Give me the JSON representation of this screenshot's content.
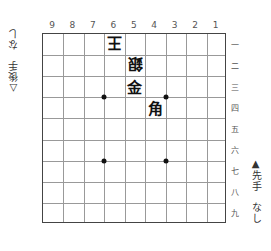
{
  "board": {
    "files": [
      "9",
      "8",
      "7",
      "6",
      "5",
      "4",
      "3",
      "2",
      "1"
    ],
    "ranks": [
      "一",
      "二",
      "三",
      "四",
      "五",
      "六",
      "七",
      "八",
      "九"
    ],
    "star_points": [
      {
        "file_index": 3,
        "rank_index": 3
      },
      {
        "file_index": 6,
        "rank_index": 3
      },
      {
        "file_index": 3,
        "rank_index": 6
      },
      {
        "file_index": 6,
        "rank_index": 6
      }
    ],
    "pieces": [
      {
        "name": "王",
        "square": "6一",
        "owner": "gote",
        "col": 3,
        "row": 0
      },
      {
        "name": "銀",
        "square": "5二",
        "owner": "gote",
        "col": 4,
        "row": 1
      },
      {
        "name": "金",
        "square": "5三",
        "owner": "sente",
        "col": 4,
        "row": 2
      },
      {
        "name": "角",
        "square": "4四",
        "owner": "sente",
        "col": 5,
        "row": 3
      }
    ]
  },
  "gote_hand": {
    "mark": "△",
    "player": "後手",
    "pieces": "なし"
  },
  "sente_hand": {
    "mark": "▲",
    "player": "先手",
    "pieces": "なし"
  }
}
